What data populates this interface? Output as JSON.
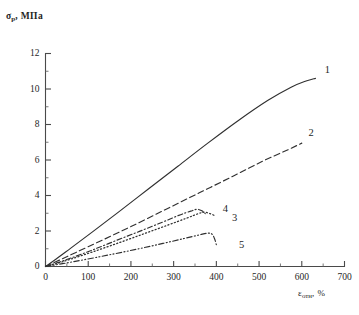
{
  "figure": {
    "background_color": "#ffffff",
    "ink_color": "#303030"
  },
  "axes": {
    "y_title_symbol": "σ",
    "y_title_subscript": "p",
    "y_title_unit": ", МПа",
    "x_title_symbol": "ε",
    "x_title_subscript": "отн",
    "x_title_unit": ", %"
  },
  "chart_data": {
    "type": "line",
    "title": "",
    "subtitle": "",
    "xlabel": "ε_отн, %",
    "ylabel": "σ_p, МПа",
    "xlim": [
      0,
      700
    ],
    "ylim": [
      0,
      12
    ],
    "x_major_ticks": [
      0,
      100,
      200,
      300,
      400,
      500,
      600,
      700
    ],
    "x_minor_ticks": [
      50,
      150,
      250,
      350,
      450,
      550,
      650
    ],
    "y_major_ticks": [
      0,
      2,
      4,
      6,
      8,
      10,
      12
    ],
    "y_minor_ticks": [
      1,
      3,
      5,
      7,
      9,
      11
    ],
    "x_tick_labels": [
      "0",
      "100",
      "200",
      "300",
      "400",
      "500",
      "600",
      "700"
    ],
    "y_tick_labels": [
      "0",
      "2",
      "4",
      "6",
      "8",
      "10",
      "12"
    ],
    "grid": false,
    "legend": "inline-curve-numbers",
    "legend_position": "right-of-curve-ends",
    "series": [
      {
        "name": "1",
        "label": "1",
        "linestyle": "solid",
        "label_x": 660,
        "label_y": 11.05,
        "x": [
          0,
          25,
          60,
          110,
          170,
          240,
          310,
          380,
          450,
          520,
          575,
          610,
          632
        ],
        "y": [
          0,
          0.42,
          1.05,
          1.95,
          3.05,
          4.35,
          5.65,
          6.95,
          8.2,
          9.35,
          10.1,
          10.45,
          10.6
        ]
      },
      {
        "name": "2",
        "label": "2",
        "linestyle": "dashed",
        "label_x": 622,
        "label_y": 7.5,
        "x": [
          0,
          30,
          70,
          130,
          200,
          280,
          360,
          440,
          510,
          565,
          600
        ],
        "y": [
          0,
          0.33,
          0.78,
          1.45,
          2.25,
          3.2,
          4.15,
          5.1,
          5.95,
          6.55,
          6.95
        ]
      },
      {
        "name": "3",
        "label": "3",
        "linestyle": "dotted",
        "label_x": 443,
        "label_y": 2.72,
        "x": [
          0,
          25,
          60,
          110,
          170,
          230,
          285,
          330,
          358,
          372,
          385,
          395
        ],
        "y": [
          0,
          0.16,
          0.42,
          0.82,
          1.32,
          1.84,
          2.32,
          2.72,
          2.98,
          3.06,
          2.98,
          2.88
        ]
      },
      {
        "name": "4",
        "label": "4",
        "linestyle": "dashdot",
        "label_x": 421,
        "label_y": 3.22,
        "x": [
          0,
          25,
          60,
          110,
          165,
          220,
          272,
          312,
          340,
          355,
          366,
          374
        ],
        "y": [
          0,
          0.19,
          0.48,
          0.93,
          1.46,
          1.98,
          2.48,
          2.88,
          3.12,
          3.22,
          3.14,
          2.98
        ]
      },
      {
        "name": "5",
        "label": "5",
        "linestyle": "dashdotdot",
        "label_x": 459,
        "label_y": 1.15,
        "x": [
          0,
          40,
          90,
          150,
          215,
          275,
          325,
          360,
          380,
          390,
          396,
          400
        ],
        "y": [
          0,
          0.16,
          0.38,
          0.66,
          0.98,
          1.3,
          1.58,
          1.78,
          1.88,
          1.82,
          1.55,
          1.22
        ]
      }
    ]
  }
}
